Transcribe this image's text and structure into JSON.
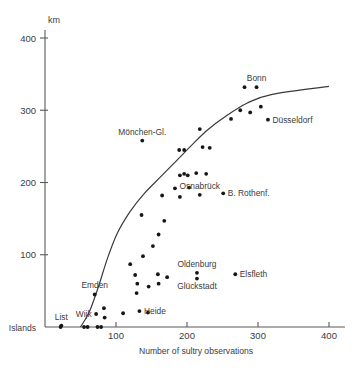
{
  "chart_data": {
    "type": "scatter",
    "title": "",
    "xlabel": "Number of sultry observations",
    "ylabel": "km",
    "xlim": [
      0,
      400
    ],
    "ylim": [
      0,
      430
    ],
    "xticks": [
      100,
      200,
      300,
      400
    ],
    "yticks": [
      100,
      200,
      300,
      400
    ],
    "y_origin_label": "Islands",
    "grid": false,
    "legend": null,
    "points": [
      {
        "x": 22,
        "y": 0
      },
      {
        "x": 55,
        "y": 0
      },
      {
        "x": 60,
        "y": 0
      },
      {
        "x": 74,
        "y": 0
      },
      {
        "x": 79,
        "y": 0
      },
      {
        "x": 72,
        "y": 18,
        "label": "Wijk",
        "label_pos": "left"
      },
      {
        "x": 70,
        "y": 45,
        "label": "Emden",
        "label_pos": "above"
      },
      {
        "x": 23,
        "y": 2,
        "label": "List",
        "label_pos": "above"
      },
      {
        "x": 83,
        "y": 26
      },
      {
        "x": 84,
        "y": 13
      },
      {
        "x": 110,
        "y": 19
      },
      {
        "x": 133,
        "y": 22,
        "label": "Heide",
        "label_pos": "right"
      },
      {
        "x": 130,
        "y": 60
      },
      {
        "x": 129,
        "y": 47
      },
      {
        "x": 127,
        "y": 72
      },
      {
        "x": 146,
        "y": 56
      },
      {
        "x": 145,
        "y": 20
      },
      {
        "x": 159,
        "y": 73
      },
      {
        "x": 160,
        "y": 60
      },
      {
        "x": 172,
        "y": 69
      },
      {
        "x": 120,
        "y": 87
      },
      {
        "x": 138,
        "y": 98
      },
      {
        "x": 152,
        "y": 112
      },
      {
        "x": 160,
        "y": 128
      },
      {
        "x": 168,
        "y": 147
      },
      {
        "x": 214,
        "y": 75,
        "label": "Oldenburg",
        "label_pos": "above"
      },
      {
        "x": 214,
        "y": 67,
        "label": "Glückstadt",
        "label_pos": "below"
      },
      {
        "x": 268,
        "y": 73,
        "label": "Elsfleth",
        "label_pos": "right"
      },
      {
        "x": 136,
        "y": 155
      },
      {
        "x": 165,
        "y": 182
      },
      {
        "x": 183,
        "y": 192
      },
      {
        "x": 190,
        "y": 210
      },
      {
        "x": 196,
        "y": 212
      },
      {
        "x": 201,
        "y": 210
      },
      {
        "x": 213,
        "y": 213
      },
      {
        "x": 203,
        "y": 193
      },
      {
        "x": 190,
        "y": 180
      },
      {
        "x": 227,
        "y": 212
      },
      {
        "x": 251,
        "y": 185,
        "label": "B. Rothenf.",
        "label_pos": "right"
      },
      {
        "x": 218,
        "y": 183,
        "label": "Osnabrück",
        "label_pos": "above"
      },
      {
        "x": 189,
        "y": 245
      },
      {
        "x": 196,
        "y": 245
      },
      {
        "x": 137,
        "y": 258,
        "label": "Mönchen-Gl.",
        "label_pos": "above"
      },
      {
        "x": 218,
        "y": 274
      },
      {
        "x": 222,
        "y": 249
      },
      {
        "x": 232,
        "y": 248
      },
      {
        "x": 262,
        "y": 288
      },
      {
        "x": 275,
        "y": 300
      },
      {
        "x": 289,
        "y": 297
      },
      {
        "x": 304,
        "y": 305
      },
      {
        "x": 314,
        "y": 287,
        "label": "Düsseldorf",
        "label_pos": "right"
      },
      {
        "x": 281,
        "y": 332
      },
      {
        "x": 298,
        "y": 332,
        "label": "Bonn",
        "label_pos": "above"
      }
    ],
    "fit_curve": {
      "description": "fitted sigmoidal trend line",
      "points": [
        {
          "x": 50,
          "y": 0
        },
        {
          "x": 62,
          "y": 20
        },
        {
          "x": 75,
          "y": 55
        },
        {
          "x": 88,
          "y": 95
        },
        {
          "x": 102,
          "y": 130
        },
        {
          "x": 120,
          "y": 160
        },
        {
          "x": 140,
          "y": 185
        },
        {
          "x": 162,
          "y": 207
        },
        {
          "x": 185,
          "y": 230
        },
        {
          "x": 205,
          "y": 250
        },
        {
          "x": 228,
          "y": 272
        },
        {
          "x": 255,
          "y": 292
        },
        {
          "x": 285,
          "y": 310
        },
        {
          "x": 320,
          "y": 322
        },
        {
          "x": 400,
          "y": 333
        }
      ]
    }
  }
}
